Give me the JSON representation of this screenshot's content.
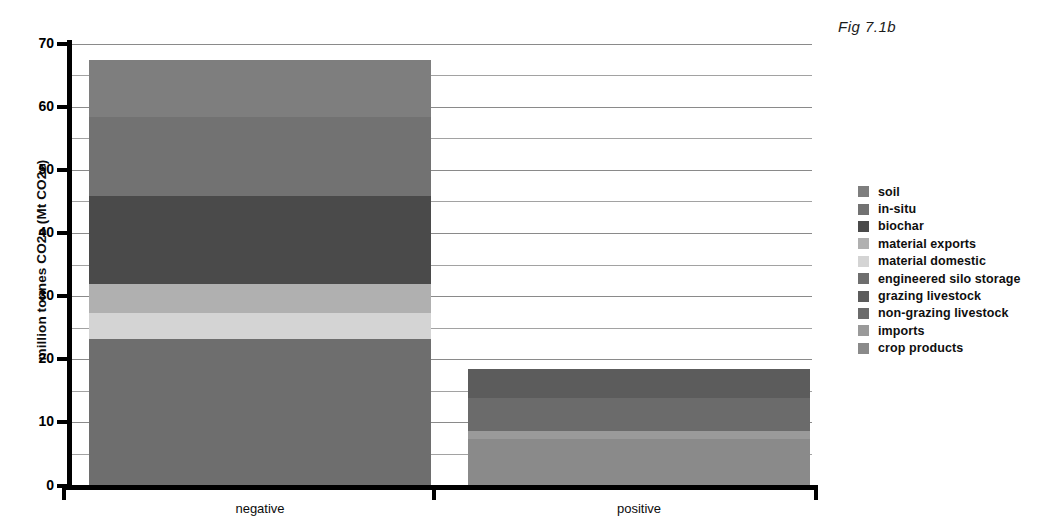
{
  "figure": {
    "caption": "Fig 7.1b"
  },
  "chart_data": {
    "type": "bar",
    "subtype": "stacked-bar",
    "title": "Fig 7.1b",
    "xlabel": "",
    "ylabel": "million tonnes CO2e (Mt CO2e)",
    "ylim": [
      0,
      70
    ],
    "ytick_labels": [
      "0",
      "10",
      "20",
      "30",
      "40",
      "50",
      "60",
      "70"
    ],
    "ytick_values": [
      0,
      10,
      20,
      30,
      40,
      50,
      60,
      70
    ],
    "minor_gridlines": [
      5,
      15,
      25,
      35,
      45,
      55,
      65
    ],
    "grid": true,
    "legend_position": "right",
    "categories": [
      "negative",
      "positive"
    ],
    "series": [
      {
        "name": "soil",
        "color": "#7e7e7e",
        "values": [
          9.0,
          0.0
        ]
      },
      {
        "name": "in-situ",
        "color": "#727272",
        "values": [
          12.5,
          0.0
        ]
      },
      {
        "name": "biochar",
        "color": "#4a4a4a",
        "values": [
          14.0,
          0.0
        ]
      },
      {
        "name": "material exports",
        "color": "#b0b0b0",
        "values": [
          4.6,
          0.0
        ]
      },
      {
        "name": "material domestic",
        "color": "#d4d4d4",
        "values": [
          4.1,
          0.0
        ]
      },
      {
        "name": "engineered silo storage",
        "color": "#6e6e6e",
        "values": [
          23.2,
          0.0
        ]
      },
      {
        "name": "grazing livestock",
        "color": "#5c5c5c",
        "values": [
          0.0,
          4.5
        ]
      },
      {
        "name": "non-grazing livestock",
        "color": "#6b6b6b",
        "values": [
          0.0,
          5.2
        ]
      },
      {
        "name": "imports",
        "color": "#9a9a9a",
        "values": [
          0.0,
          1.3
        ]
      },
      {
        "name": "crop products",
        "color": "#8a8a8a",
        "values": [
          0.0,
          7.4
        ]
      }
    ],
    "totals": {
      "negative": 67.4,
      "positive": 18.4
    }
  },
  "legend": {
    "items": [
      {
        "label": "soil"
      },
      {
        "label": "in-situ"
      },
      {
        "label": "biochar"
      },
      {
        "label": "material exports"
      },
      {
        "label": "material domestic"
      },
      {
        "label": "engineered silo storage"
      },
      {
        "label": "grazing livestock"
      },
      {
        "label": "non-grazing livestock"
      },
      {
        "label": "imports"
      },
      {
        "label": "crop products"
      }
    ]
  }
}
